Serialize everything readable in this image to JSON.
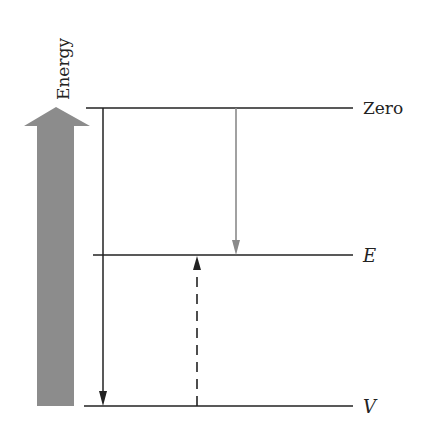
{
  "diagram": {
    "axis_label": "Energy",
    "levels": [
      {
        "id": "zero",
        "label": "Zero",
        "italic": false
      },
      {
        "id": "e",
        "label": "E",
        "italic": true
      },
      {
        "id": "v",
        "label": "V",
        "italic": true
      }
    ],
    "arrows": [
      {
        "id": "zero-to-v",
        "from": "Zero",
        "to": "V",
        "style": "solid",
        "color": "#222222"
      },
      {
        "id": "zero-to-e",
        "from": "Zero",
        "to": "E",
        "style": "solid",
        "color": "#8a8a8a"
      },
      {
        "id": "v-to-e",
        "from": "V",
        "to": "E",
        "style": "dashed",
        "color": "#222222"
      }
    ],
    "colors": {
      "energy_arrow": "#8c8c8c",
      "line": "#222222"
    }
  }
}
